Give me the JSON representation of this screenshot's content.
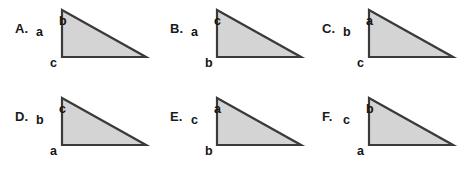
{
  "figure": {
    "background_color": "#ffffff",
    "triangle_fill_color": "#d4d4d4",
    "triangle_stroke_color": "#3a3a3a",
    "text_color": "#141414",
    "shape": "right-triangle",
    "right_angle_corner": "bottom-left",
    "options": [
      {
        "letter": "A.",
        "leg_label": "a",
        "hypotenuse_label": "b",
        "base_label": "c"
      },
      {
        "letter": "B.",
        "leg_label": "a",
        "hypotenuse_label": "c",
        "base_label": "b"
      },
      {
        "letter": "C.",
        "leg_label": "b",
        "hypotenuse_label": "a",
        "base_label": "c"
      },
      {
        "letter": "D.",
        "leg_label": "b",
        "hypotenuse_label": "c",
        "base_label": "a"
      },
      {
        "letter": "E.",
        "leg_label": "c",
        "hypotenuse_label": "a",
        "base_label": "b"
      },
      {
        "letter": "F.",
        "leg_label": "c",
        "hypotenuse_label": "b",
        "base_label": "a"
      }
    ]
  }
}
